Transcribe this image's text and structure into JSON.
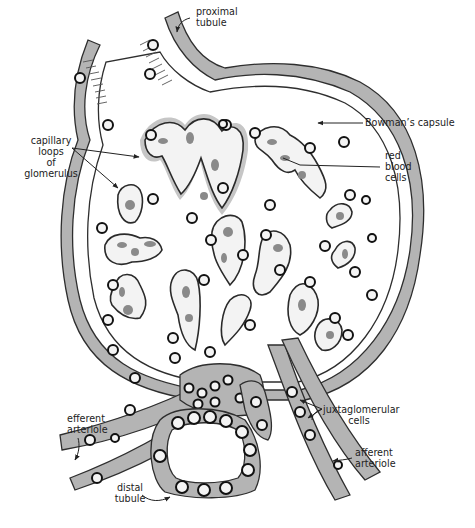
{
  "figure": {
    "colors": {
      "background": "#ffffff",
      "tissue": "#b4b4b4",
      "outline": "#2e2e2e",
      "rbc": "#8a8a8a",
      "text": "#222222"
    }
  },
  "labels": {
    "proximal_tubule": "proximal\ntubule",
    "bowmans_capsule": "Bowman’s capsule",
    "capillary_loops": "capillary\nloops\nof\nglomerulus",
    "red_blood_cells": "red\nblood\ncells",
    "efferent_arteriole": "efferent\narteriole",
    "juxtaglomerular_cells": "juxtaglomerular\ncells",
    "afferent_arteriole": "afferent\narteriole",
    "distal_tubule": "distal\ntubule"
  }
}
